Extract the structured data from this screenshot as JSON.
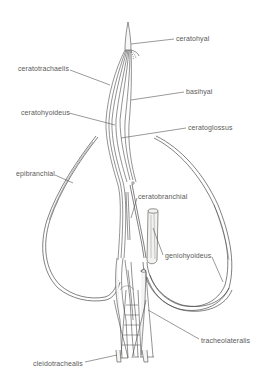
{
  "diagram": {
    "type": "anatomical-illustration",
    "labels": [
      {
        "id": "ceratohyal",
        "text": "ceratohyal",
        "x": 176,
        "y": 35
      },
      {
        "id": "ceratotrachaelis",
        "text": "ceratotrachaelis",
        "x": 18,
        "y": 65
      },
      {
        "id": "basihyal",
        "text": "basihyal",
        "x": 186,
        "y": 88
      },
      {
        "id": "ceratohyoideus",
        "text": "ceratohyoideus",
        "x": 21,
        "y": 109
      },
      {
        "id": "ceratoglossus",
        "text": "ceratoglossus",
        "x": 188,
        "y": 124
      },
      {
        "id": "epibranchial",
        "text": "epibranchial",
        "x": 16,
        "y": 170
      },
      {
        "id": "ceratobranchial",
        "text": "ceratobranchial",
        "x": 138,
        "y": 193
      },
      {
        "id": "geniohyoideus",
        "text": "geniohyoideus",
        "x": 165,
        "y": 252
      },
      {
        "id": "tracheolateralis",
        "text": "tracheolateralis",
        "x": 201,
        "y": 337
      },
      {
        "id": "cleidotrachealis",
        "text": "cleidotrachealis",
        "x": 33,
        "y": 360
      }
    ],
    "colors": {
      "line": "#4a4a4a",
      "leader": "#555555",
      "text": "#5a5a5a",
      "fill": "#f2f2f0"
    }
  }
}
